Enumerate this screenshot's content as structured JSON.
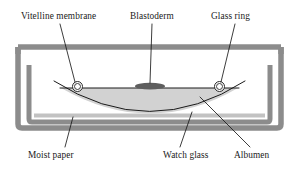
{
  "figure": {
    "type": "cross-section-diagram",
    "background_color": "#ffffff"
  },
  "labels": {
    "vitelline_membrane": "Vitelline membrane",
    "blastoderm": "Blastoderm",
    "glass_ring": "Glass ring",
    "moist_paper": "Moist paper",
    "watch_glass": "Watch glass",
    "albumen": "Albumen"
  },
  "parts": {
    "outer_dish": {
      "name": "outer-dish",
      "color": "#8c8c8c"
    },
    "inner_dish": {
      "name": "inner-dish",
      "color": "#8c8c8c"
    },
    "moist_paper_strip": {
      "name": "moist-paper-strip",
      "color": "#c2c2c2"
    },
    "albumen_fill": {
      "name": "albumen-fill",
      "color": "#d2d2d2"
    },
    "watch_glass_curve": {
      "name": "watch-glass-curve",
      "color": "#1a1a1a"
    },
    "vitelline_membrane_line": {
      "name": "vitelline-membrane-line",
      "color": "#1a1a1a"
    },
    "blastoderm_blob": {
      "name": "blastoderm-blob",
      "color": "#5e5e5e"
    },
    "glass_ring_left": {
      "name": "glass-ring-left",
      "color": "#2b2b2b"
    },
    "glass_ring_right": {
      "name": "glass-ring-right",
      "color": "#2b2b2b"
    },
    "leader_lines": {
      "name": "leader-lines",
      "color": "#1a1a1a"
    }
  },
  "colors": {
    "ink": "#1a1a1a",
    "dish_gray": "#8c8c8c",
    "paper_gray": "#c2c2c2",
    "albumen_gray": "#d2d2d2",
    "blastoderm_gray": "#5e5e5e",
    "page_white": "#ffffff"
  }
}
